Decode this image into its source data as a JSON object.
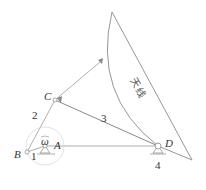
{
  "diagram": {
    "title": "",
    "points": {
      "A": "A",
      "B": "B",
      "C": "C",
      "D": "D",
      "omega": "ω"
    },
    "links": {
      "l1": "1",
      "l2": "2",
      "l3": "3",
      "l4": "4"
    },
    "antenna_label_1": "天",
    "antenna_label_2": "线",
    "colors": {
      "line": "#8a8a8a",
      "text": "#333333"
    }
  }
}
